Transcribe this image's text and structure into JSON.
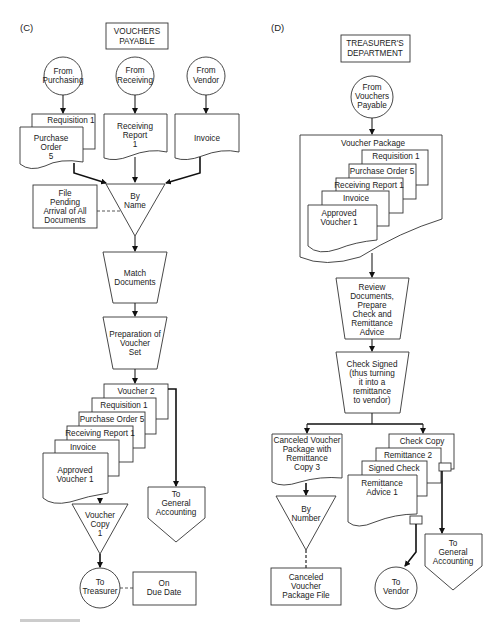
{
  "panels": {
    "c": {
      "label": "(C)",
      "department": [
        "VOUCHERS",
        "PAYABLE"
      ],
      "sources": [
        {
          "lines": [
            "From",
            "Purchasing"
          ]
        },
        {
          "lines": [
            "From",
            "Receiving"
          ]
        },
        {
          "lines": [
            "From",
            "Vendor"
          ]
        }
      ],
      "input_docs": {
        "requisition": "Requisition 1",
        "purchase_order": [
          "Purchase",
          "Order",
          "5"
        ],
        "receiving_report": [
          "Receiving",
          "Report",
          "1"
        ],
        "invoice": "Invoice"
      },
      "file_pending": [
        "File",
        "Pending",
        "Arrival of All",
        "Documents"
      ],
      "by_name": [
        "By",
        "Name"
      ],
      "match_documents": [
        "Match",
        "Documents"
      ],
      "preparation": [
        "Preparation of",
        "Voucher",
        "Set"
      ],
      "voucher_set": {
        "voucher2": "Voucher 2",
        "requisition": "Requisition 1",
        "purchase_order": "Purchase Order 5",
        "receiving_report": "Receiving Report 1",
        "invoice": "Invoice",
        "approved_voucher": [
          "Approved",
          "Voucher 1"
        ]
      },
      "to_general_accounting": [
        "To",
        "General",
        "Accounting"
      ],
      "voucher_copy": [
        "Voucher",
        "Copy",
        "1"
      ],
      "to_treasurer": [
        "To",
        "Treasurer"
      ],
      "on_due_date": [
        "On",
        "Due Date"
      ]
    },
    "d": {
      "label": "(D)",
      "department": [
        "TREASURER'S",
        "DEPARTMENT"
      ],
      "source": [
        "From",
        "Vouchers",
        "Payable"
      ],
      "voucher_package": {
        "title": "Voucher Package",
        "requisition": "Requisition 1",
        "purchase_order": "Purchase Order 5",
        "receiving_report": "Receiving Report 1",
        "invoice": "Invoice",
        "approved_voucher": [
          "Approved",
          "Voucher 1"
        ]
      },
      "review": [
        "Review",
        "Documents,",
        "Prepare",
        "Check and",
        "Remittance",
        "Advice"
      ],
      "check_signed": [
        "Check Signed",
        "(thus turning",
        "it into a",
        "remittance",
        "to vendor)"
      ],
      "canceled_package": [
        "Canceled Voucher",
        "Package with",
        "Remittance",
        "Copy 3"
      ],
      "by_number": [
        "By",
        "Number"
      ],
      "canceled_file": [
        "Canceled",
        "Voucher",
        "Package File"
      ],
      "check_set": {
        "check_copy": "Check Copy",
        "remittance2": "Remittance 2",
        "signed_check": "Signed Check",
        "remittance_advice": [
          "Remittance",
          "Advice 1"
        ]
      },
      "to_vendor": [
        "To",
        "Vendor"
      ],
      "to_general_accounting": [
        "To",
        "General",
        "Accounting"
      ]
    }
  }
}
